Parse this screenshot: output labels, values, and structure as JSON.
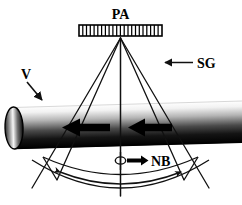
{
  "figure": {
    "background_color": "#ffffff",
    "line_color": "#111111",
    "width": 242,
    "height": 205
  },
  "labels": {
    "phased_array": "PA",
    "sector_group": "SG",
    "velocity": "V",
    "normal_beam": "NB"
  },
  "components": {
    "transducer": {
      "name": "phased-array-transducer",
      "element_count": 22,
      "x": 79,
      "y": 25,
      "width": 83,
      "height": 11,
      "fill": "#ffffff",
      "stroke": "#000000"
    },
    "apex": {
      "x": 120.5,
      "y": 38
    },
    "beams": [
      {
        "name": "left-outer-beam",
        "angle_deg": -36
      },
      {
        "name": "left-inner-beam",
        "angle_deg": -27
      },
      {
        "name": "center-beam",
        "angle_deg": 0
      },
      {
        "name": "right-inner-beam",
        "angle_deg": 27
      },
      {
        "name": "right-outer-beam",
        "angle_deg": 36
      }
    ],
    "pipe": {
      "name": "pipe-cylinder",
      "left_x": 14,
      "right_x": 242,
      "top_y": 104,
      "bottom_y": 146,
      "gradient_top_color": "#ffffff",
      "gradient_bottom_color": "#000000",
      "end_cap_rx": 9,
      "end_cap_ry": 21
    },
    "flow_arrows": [
      {
        "name": "flow-arrow-left",
        "direction": "left",
        "tip_x": 64,
        "tail_x": 110,
        "y": 128
      },
      {
        "name": "flow-arrow-right",
        "direction": "left",
        "tip_x": 130,
        "tail_x": 172,
        "y": 128
      }
    ],
    "sweep_arc": {
      "name": "beam-sweep-arc",
      "double_headed": true,
      "radius": 130
    },
    "outer_arc": {
      "name": "sector-outer-arc",
      "radius": 155
    },
    "rotation_symbol": {
      "name": "rotation-loop-icon",
      "cx": 121,
      "cy": 160
    }
  },
  "annotations": [
    {
      "id": "pa",
      "label": "PA",
      "x": 120,
      "y": 14,
      "anchor": "middle",
      "pointer": "none"
    },
    {
      "id": "sg",
      "label": "SG",
      "x": 200,
      "y": 67,
      "anchor": "start",
      "pointer": "arrow-left"
    },
    {
      "id": "v",
      "label": "V",
      "x": 28,
      "y": 80,
      "anchor": "middle",
      "pointer": "arrow-down-right"
    },
    {
      "id": "nb",
      "label": "NB",
      "x": 150,
      "y": 164,
      "anchor": "start",
      "pointer": "arrow-right"
    }
  ]
}
